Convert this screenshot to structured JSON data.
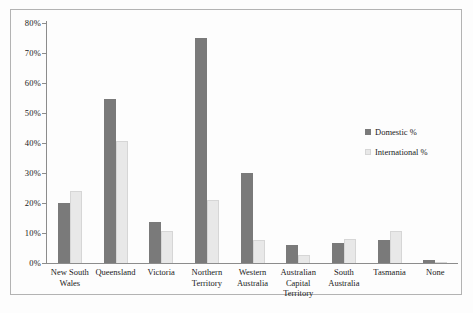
{
  "chart_data": {
    "type": "bar",
    "title": "",
    "xlabel": "",
    "ylabel": "",
    "ylim": [
      0,
      80
    ],
    "grid": false,
    "legend_position": "right",
    "categories": [
      "New South Wales",
      "Queensland",
      "Victoria",
      "Northern Territory",
      "Western Australia",
      "Australian Capital Territory",
      "South Australia",
      "Tasmania",
      "None"
    ],
    "series": [
      {
        "name": "Domestic %",
        "color": "#7a7a7a",
        "light": false,
        "values": [
          20,
          54.5,
          13.5,
          75,
          30,
          6,
          6.5,
          7.5,
          1
        ]
      },
      {
        "name": "International %",
        "color": "#e8e8e8",
        "light": true,
        "values": [
          24,
          40.5,
          10.5,
          21,
          7.5,
          2.5,
          8,
          10.5,
          0
        ]
      }
    ],
    "yticks": [
      {
        "value": 0,
        "label": "0%"
      },
      {
        "value": 10,
        "label": "10%"
      },
      {
        "value": 20,
        "label": "20%"
      },
      {
        "value": 30,
        "label": "30%"
      },
      {
        "value": 40,
        "label": "40%"
      },
      {
        "value": 50,
        "label": "50%"
      },
      {
        "value": 60,
        "label": "60%"
      },
      {
        "value": 70,
        "label": "70%"
      },
      {
        "value": 80,
        "label": "80%"
      }
    ]
  },
  "colors": {
    "domestic": "#7a7a7a",
    "international": "#e8e8e8",
    "frame_border": "#b3b3b3",
    "axis": "#8c8c8c",
    "text": "#1a1a1a",
    "background": "#fdfdfd"
  }
}
